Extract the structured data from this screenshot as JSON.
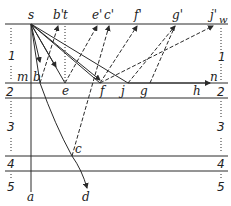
{
  "diagram": {
    "colors": {
      "ink": "#2a2a2a",
      "background": "#ffffff"
    },
    "point_labels": {
      "s": "s",
      "b_prime": "b'",
      "t": "t",
      "e_prime": "e'",
      "c_prime": "c'",
      "f_prime": "f'",
      "g_prime": "g'",
      "j_prime": "j'",
      "w": "w",
      "m": "m",
      "b": "b",
      "e": "e",
      "f": "f",
      "j": "j",
      "g": "g",
      "h": "h",
      "n": "n",
      "c": "c",
      "a": "a",
      "d": "d"
    },
    "layer_labels": {
      "left": [
        "1",
        "2",
        "3",
        "4",
        "5"
      ],
      "right": [
        "1",
        "2",
        "3",
        "4",
        "5"
      ]
    }
  }
}
